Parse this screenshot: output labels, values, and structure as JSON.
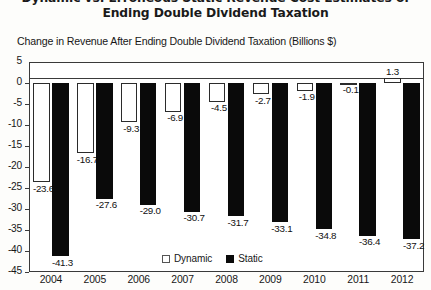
{
  "chart_data": {
    "type": "bar",
    "title": "Dynamic vs. Erroneous Static Revenue Cost Estimates of Ending Double Dividend Taxation",
    "title_lines": [
      "Dynamic vs. Erroneous Static Revenue Cost Estimates of",
      "Ending Double Dividend Taxation"
    ],
    "subtitle": "Change in Revenue After Ending Double Dividend Taxation (Billions $)",
    "xlabel": "",
    "ylabel": "",
    "categories": [
      "2004",
      "2005",
      "2006",
      "2007",
      "2008",
      "2009",
      "2010",
      "2011",
      "2012"
    ],
    "series": [
      {
        "name": "Dynamic",
        "color": "#ffffff",
        "values": [
          -23.6,
          -16.7,
          -9.3,
          -6.9,
          -4.5,
          -2.7,
          -1.9,
          -0.1,
          1.3
        ],
        "labels": [
          "-23.6",
          "-16.7",
          "-9.3",
          "-6.9",
          "-4.5",
          "-2.7",
          "-1.9",
          "-0.1",
          "1.3"
        ]
      },
      {
        "name": "Static",
        "color": "#0a0a0a",
        "values": [
          -41.3,
          -27.6,
          -29.0,
          -30.7,
          -31.7,
          -33.1,
          -34.8,
          -36.4,
          -37.2
        ],
        "labels": [
          "-41.3",
          "-27.6",
          "-29.0",
          "-30.7",
          "-31.7",
          "-33.1",
          "-34.8",
          "-36.4",
          "-37.2"
        ]
      }
    ],
    "ylim": [
      -45,
      5
    ],
    "yticks": [
      5,
      0,
      -5,
      -10,
      -15,
      -20,
      -25,
      -30,
      -35,
      -40,
      -45
    ],
    "ytick_labels": [
      "5",
      "0",
      "-5",
      "-10",
      "-15",
      "-20",
      "-25",
      "-30",
      "-35",
      "-40",
      "-45"
    ],
    "grid": false,
    "legend_position": "inside-bottom-center",
    "legend": [
      {
        "label": "Dynamic",
        "swatch": "white-outlined"
      },
      {
        "label": "Static",
        "swatch": "black-filled"
      }
    ]
  }
}
